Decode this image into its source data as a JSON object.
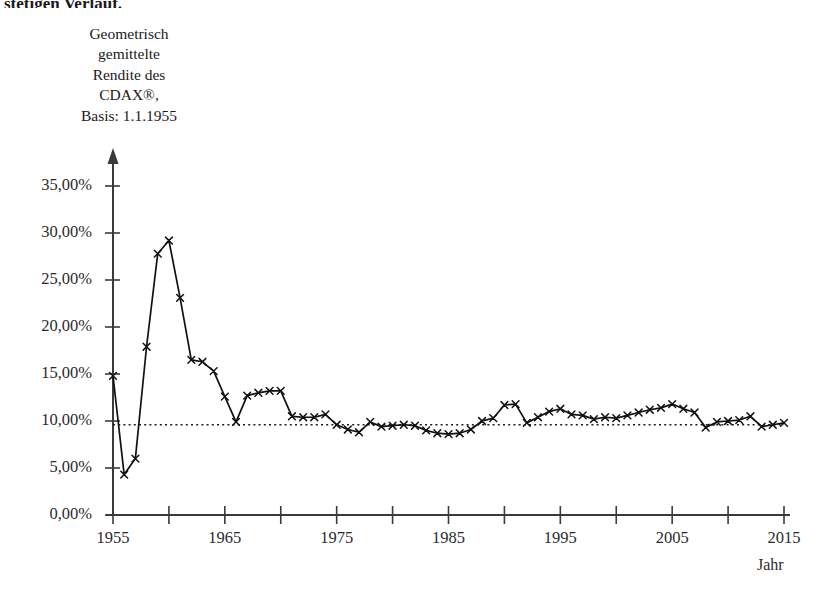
{
  "page": {
    "truncated_text_above": "stetigen Verlauf.",
    "background_color": "#ffffff",
    "ink_color": "#1a1a1a"
  },
  "chart_data": {
    "type": "line",
    "title": "Geometrisch gemittelte Rendite des CDAX®, Basis: 1.1.1955",
    "title_lines": [
      "Geometrisch",
      "gemittelte",
      "Rendite des",
      "CDAX®,",
      "Basis: 1.1.1955"
    ],
    "xlabel": "Jahr",
    "ylabel": "Geometrisch gemittelte Rendite des CDAX®, Basis: 1.1.1955",
    "xlim": [
      1955,
      2015
    ],
    "ylim": [
      0,
      37
    ],
    "grid": false,
    "legend": false,
    "marker": "x-cross",
    "line_color": "#111111",
    "y_tick_labels": [
      "0,00%",
      "5,00%",
      "10,00%",
      "15,00%",
      "20,00%",
      "25,00%",
      "30,00%",
      "35,00%"
    ],
    "y_tick_values": [
      0,
      5,
      10,
      15,
      20,
      25,
      30,
      35
    ],
    "x_tick_labels": [
      "1955",
      "1965",
      "1975",
      "1985",
      "1995",
      "2005",
      "2015"
    ],
    "x_tick_values": [
      1955,
      1965,
      1975,
      1985,
      1995,
      2005,
      2015
    ],
    "x_minor_tick_values": [
      1960,
      1970,
      1980,
      1990,
      2000,
      2010
    ],
    "reference_line": {
      "label": "Langfristiger Mittelwert",
      "value": 9.6,
      "style": "dotted",
      "x_start": 1955,
      "x_end": 2015
    },
    "series": [
      {
        "name": "Geometrisch gemittelte Rendite des CDAX®",
        "x": [
          1955,
          1956,
          1957,
          1958,
          1959,
          1960,
          1961,
          1962,
          1963,
          1964,
          1965,
          1966,
          1967,
          1968,
          1969,
          1970,
          1971,
          1972,
          1973,
          1974,
          1975,
          1976,
          1977,
          1978,
          1979,
          1980,
          1981,
          1982,
          1983,
          1984,
          1985,
          1986,
          1987,
          1988,
          1989,
          1990,
          1991,
          1992,
          1993,
          1994,
          1995,
          1996,
          1997,
          1998,
          1999,
          2000,
          2001,
          2002,
          2003,
          2004,
          2005,
          2006,
          2007,
          2008,
          2009,
          2010,
          2011,
          2012,
          2013,
          2014,
          2015
        ],
        "values": [
          14.8,
          4.3,
          6.0,
          17.9,
          27.8,
          29.2,
          23.1,
          16.5,
          16.3,
          15.3,
          12.6,
          9.9,
          12.7,
          13.0,
          13.2,
          13.2,
          10.5,
          10.4,
          10.4,
          10.7,
          9.6,
          9.1,
          8.8,
          9.9,
          9.4,
          9.5,
          9.6,
          9.5,
          9.0,
          8.7,
          8.6,
          8.7,
          9.1,
          10.0,
          10.3,
          11.7,
          11.8,
          9.8,
          10.4,
          11.0,
          11.3,
          10.7,
          10.6,
          10.2,
          10.4,
          10.3,
          10.6,
          10.9,
          11.2,
          11.4,
          11.8,
          11.3,
          10.9,
          9.3,
          9.9,
          10.0,
          10.1,
          10.5,
          9.4,
          9.6,
          9.8
        ]
      }
    ]
  }
}
